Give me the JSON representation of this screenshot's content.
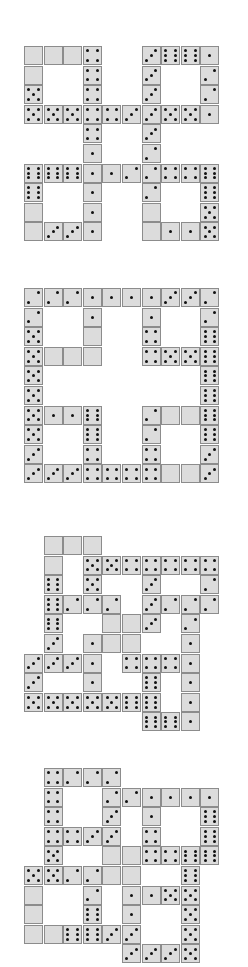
{
  "colors": {
    "tile": "#dcdcdc",
    "border": "#8c8c8c",
    "pip": "#111111",
    "background": "#ffffff"
  },
  "cell_size": 19.6,
  "puzzles": [
    {
      "name": "puzzle-1",
      "origin": [
        24,
        46
      ],
      "cells": [
        [
          0,
          0,
          0
        ],
        [
          1,
          0,
          0
        ],
        [
          2,
          0,
          0
        ],
        [
          3,
          0,
          4
        ],
        [
          6,
          0,
          3
        ],
        [
          7,
          0,
          6
        ],
        [
          8,
          0,
          6
        ],
        [
          9,
          0,
          1
        ],
        [
          0,
          1,
          0
        ],
        [
          3,
          1,
          4
        ],
        [
          6,
          1,
          3
        ],
        [
          9,
          1,
          2
        ],
        [
          0,
          2,
          5
        ],
        [
          3,
          2,
          4
        ],
        [
          6,
          2,
          3
        ],
        [
          9,
          2,
          2
        ],
        [
          0,
          3,
          5
        ],
        [
          1,
          3,
          5
        ],
        [
          2,
          3,
          5
        ],
        [
          3,
          3,
          4
        ],
        [
          4,
          3,
          4
        ],
        [
          5,
          3,
          3
        ],
        [
          6,
          3,
          3
        ],
        [
          7,
          3,
          5
        ],
        [
          8,
          3,
          5
        ],
        [
          9,
          3,
          1
        ],
        [
          3,
          4,
          4
        ],
        [
          6,
          4,
          3
        ],
        [
          3,
          5,
          1
        ],
        [
          6,
          5,
          2
        ],
        [
          0,
          6,
          6
        ],
        [
          1,
          6,
          6
        ],
        [
          2,
          6,
          6
        ],
        [
          3,
          6,
          1
        ],
        [
          4,
          6,
          1
        ],
        [
          5,
          6,
          2
        ],
        [
          6,
          6,
          2
        ],
        [
          7,
          6,
          4
        ],
        [
          8,
          6,
          4
        ],
        [
          9,
          6,
          6
        ],
        [
          0,
          7,
          6
        ],
        [
          3,
          7,
          1
        ],
        [
          6,
          7,
          2
        ],
        [
          9,
          7,
          6
        ],
        [
          0,
          8,
          0
        ],
        [
          3,
          8,
          1
        ],
        [
          6,
          8,
          0
        ],
        [
          9,
          8,
          5
        ],
        [
          0,
          9,
          0
        ],
        [
          1,
          9,
          3
        ],
        [
          2,
          9,
          3
        ],
        [
          3,
          9,
          1
        ],
        [
          6,
          9,
          0
        ],
        [
          7,
          9,
          1
        ],
        [
          8,
          9,
          1
        ],
        [
          9,
          9,
          5
        ]
      ]
    },
    {
      "name": "puzzle-2",
      "origin": [
        24,
        288
      ],
      "cells": [
        [
          0,
          0,
          2
        ],
        [
          1,
          0,
          2
        ],
        [
          2,
          0,
          2
        ],
        [
          3,
          0,
          1
        ],
        [
          4,
          0,
          1
        ],
        [
          5,
          0,
          1
        ],
        [
          6,
          0,
          1
        ],
        [
          7,
          0,
          3
        ],
        [
          8,
          0,
          3
        ],
        [
          9,
          0,
          2
        ],
        [
          0,
          1,
          2
        ],
        [
          3,
          1,
          1
        ],
        [
          6,
          1,
          1
        ],
        [
          9,
          1,
          2
        ],
        [
          0,
          2,
          5
        ],
        [
          3,
          2,
          0
        ],
        [
          6,
          2,
          4
        ],
        [
          9,
          2,
          6
        ],
        [
          0,
          3,
          5
        ],
        [
          1,
          3,
          0
        ],
        [
          2,
          3,
          0
        ],
        [
          3,
          3,
          0
        ],
        [
          6,
          3,
          4
        ],
        [
          7,
          3,
          5
        ],
        [
          8,
          3,
          5
        ],
        [
          9,
          3,
          6
        ],
        [
          0,
          4,
          5
        ],
        [
          9,
          4,
          6
        ],
        [
          0,
          5,
          5
        ],
        [
          9,
          5,
          6
        ],
        [
          0,
          6,
          5
        ],
        [
          1,
          6,
          1
        ],
        [
          2,
          6,
          1
        ],
        [
          3,
          6,
          6
        ],
        [
          6,
          6,
          2
        ],
        [
          7,
          6,
          0
        ],
        [
          8,
          6,
          0
        ],
        [
          9,
          6,
          6
        ],
        [
          0,
          7,
          5
        ],
        [
          3,
          7,
          6
        ],
        [
          6,
          7,
          2
        ],
        [
          9,
          7,
          6
        ],
        [
          0,
          8,
          3
        ],
        [
          3,
          8,
          4
        ],
        [
          6,
          8,
          4
        ],
        [
          9,
          8,
          3
        ],
        [
          0,
          9,
          3
        ],
        [
          1,
          9,
          3
        ],
        [
          2,
          9,
          3
        ],
        [
          3,
          9,
          4
        ],
        [
          4,
          9,
          4
        ],
        [
          5,
          9,
          4
        ],
        [
          6,
          9,
          4
        ],
        [
          7,
          9,
          0
        ],
        [
          8,
          9,
          0
        ],
        [
          9,
          9,
          3
        ]
      ]
    },
    {
      "name": "puzzle-3",
      "origin": [
        24,
        536
      ],
      "cells": [
        [
          1,
          0,
          0
        ],
        [
          2,
          0,
          0
        ],
        [
          3,
          0,
          0
        ],
        [
          1,
          1,
          0
        ],
        [
          3,
          1,
          5
        ],
        [
          4,
          1,
          5
        ],
        [
          5,
          1,
          4
        ],
        [
          6,
          1,
          4
        ],
        [
          7,
          1,
          4
        ],
        [
          8,
          1,
          4
        ],
        [
          9,
          1,
          4
        ],
        [
          1,
          2,
          6
        ],
        [
          3,
          2,
          5
        ],
        [
          6,
          2,
          3
        ],
        [
          9,
          2,
          2
        ],
        [
          1,
          3,
          6
        ],
        [
          2,
          3,
          2
        ],
        [
          3,
          3,
          2
        ],
        [
          4,
          3,
          2
        ],
        [
          6,
          3,
          3
        ],
        [
          7,
          3,
          2
        ],
        [
          8,
          3,
          2
        ],
        [
          9,
          3,
          2
        ],
        [
          1,
          4,
          6
        ],
        [
          4,
          4,
          0
        ],
        [
          5,
          4,
          0
        ],
        [
          6,
          4,
          3
        ],
        [
          8,
          4,
          2
        ],
        [
          1,
          5,
          3
        ],
        [
          3,
          5,
          1
        ],
        [
          4,
          5,
          0
        ],
        [
          5,
          5,
          0
        ],
        [
          8,
          5,
          1
        ],
        [
          0,
          6,
          3
        ],
        [
          1,
          6,
          3
        ],
        [
          2,
          6,
          3
        ],
        [
          3,
          6,
          1
        ],
        [
          5,
          6,
          4
        ],
        [
          6,
          6,
          4
        ],
        [
          7,
          6,
          4
        ],
        [
          8,
          6,
          1
        ],
        [
          0,
          7,
          3
        ],
        [
          3,
          7,
          1
        ],
        [
          6,
          7,
          6
        ],
        [
          8,
          7,
          1
        ],
        [
          0,
          8,
          5
        ],
        [
          1,
          8,
          5
        ],
        [
          2,
          8,
          5
        ],
        [
          3,
          8,
          5
        ],
        [
          4,
          8,
          5
        ],
        [
          5,
          8,
          6
        ],
        [
          6,
          8,
          6
        ],
        [
          8,
          8,
          1
        ],
        [
          6,
          9,
          6
        ],
        [
          7,
          9,
          6
        ],
        [
          8,
          9,
          1
        ]
      ]
    },
    {
      "name": "puzzle-4",
      "origin": [
        24,
        768
      ],
      "cells": [
        [
          1,
          0,
          4
        ],
        [
          2,
          0,
          2
        ],
        [
          3,
          0,
          2
        ],
        [
          4,
          0,
          2
        ],
        [
          1,
          1,
          4
        ],
        [
          4,
          1,
          2
        ],
        [
          5,
          1,
          2
        ],
        [
          6,
          1,
          1
        ],
        [
          7,
          1,
          1
        ],
        [
          8,
          1,
          1
        ],
        [
          9,
          1,
          1
        ],
        [
          1,
          2,
          4
        ],
        [
          4,
          2,
          3
        ],
        [
          6,
          2,
          1
        ],
        [
          9,
          2,
          6
        ],
        [
          1,
          3,
          4
        ],
        [
          2,
          3,
          4
        ],
        [
          3,
          3,
          3
        ],
        [
          4,
          3,
          3
        ],
        [
          6,
          3,
          4
        ],
        [
          9,
          3,
          6
        ],
        [
          1,
          4,
          5
        ],
        [
          4,
          4,
          0
        ],
        [
          5,
          4,
          0
        ],
        [
          6,
          4,
          4
        ],
        [
          7,
          4,
          4
        ],
        [
          8,
          4,
          6
        ],
        [
          9,
          4,
          6
        ],
        [
          0,
          5,
          5
        ],
        [
          1,
          5,
          5
        ],
        [
          2,
          5,
          2
        ],
        [
          3,
          5,
          2
        ],
        [
          4,
          5,
          0
        ],
        [
          5,
          5,
          0
        ],
        [
          8,
          5,
          6
        ],
        [
          0,
          6,
          0
        ],
        [
          3,
          6,
          2
        ],
        [
          5,
          6,
          1
        ],
        [
          6,
          6,
          1
        ],
        [
          7,
          6,
          5
        ],
        [
          8,
          6,
          5
        ],
        [
          0,
          7,
          0
        ],
        [
          3,
          7,
          6
        ],
        [
          5,
          7,
          1
        ],
        [
          8,
          7,
          5
        ],
        [
          0,
          8,
          0
        ],
        [
          1,
          8,
          0
        ],
        [
          2,
          8,
          6
        ],
        [
          3,
          8,
          6
        ],
        [
          4,
          8,
          3
        ],
        [
          5,
          8,
          3
        ],
        [
          8,
          8,
          5
        ],
        [
          5,
          9,
          3
        ],
        [
          6,
          9,
          3
        ],
        [
          7,
          9,
          3
        ],
        [
          8,
          9,
          5
        ]
      ]
    }
  ]
}
